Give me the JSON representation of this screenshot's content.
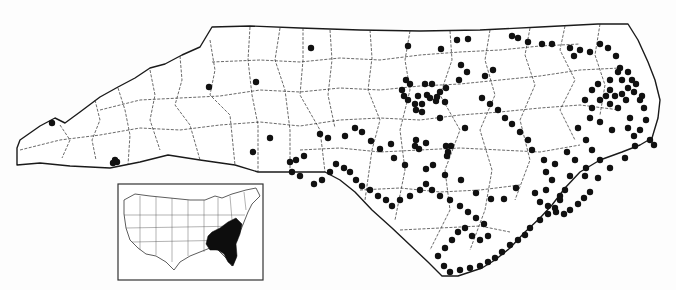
{
  "map": {
    "title": "",
    "colors": {
      "background": "#fdfdfd",
      "outline": "#1a1a1a",
      "dot": "#111111",
      "range": "#0d0d0d"
    },
    "state_outline": "M17,148 L20,140 L40,126 L55,118 L65,123 L80,112 L100,97 L118,87 L135,78 L150,68 L165,64 L182,55 L200,47 L212,27 L250,26 L300,28 L360,30 L420,31 L480,30 L540,27 L598,24 L628,24 L638,40 L648,62 L655,80 L660,100 L658,118 L652,138 L640,145 L622,152 L600,160 L580,172 L565,188 L552,205 L540,218 L525,232 L510,248 L495,260 L482,268 L470,272 L458,276 L442,276 L428,262 L410,245 L392,228 L372,210 L355,192 L340,180 L325,172 L290,172 L258,172 L235,165 L200,160 L168,155 L140,162 L110,168 L70,166 L40,163 L17,165 Z",
    "county_lines": [
      "M60,125 L70,140 L62,158",
      "M95,100 L100,120 L92,140 L96,160",
      "M118,88 L125,110 L130,135 L128,165",
      "M150,70 L155,95 L150,120 L160,150",
      "M180,56 L182,80 L175,105 L190,125 L200,160",
      "M210,40 L215,70 L210,95 L230,115 L235,165",
      "M250,27 L248,60 L252,95 L258,125 L258,172",
      "M280,28 L275,60 L285,90 L290,130 L290,172",
      "M303,28 L303,60 L300,95 L320,130 L325,172",
      "M330,30 L332,60 L328,95 L335,128",
      "M370,30 L372,58 L368,90 L380,120 L372,150 L365,200",
      "M410,31 L405,60 L410,90 L400,130 L405,170 L395,220",
      "M450,31 L452,60 L440,95 L460,130 L445,170 L450,210 L430,250",
      "M490,30 L485,60 L495,95 L480,130 L492,170 L485,210 L470,250",
      "M530,28 L525,55 L535,85 L520,120 L530,160 L515,200",
      "M565,26 L560,50 L575,80 L560,110 L575,140",
      "M600,24 L595,55 L605,85 L600,115",
      "M20,150 L60,140 L100,135 L140,128 L180,130 L220,125 L260,122 L300,126 L340,120 L380,118 L420,120 L460,115 L500,112 L540,108 L580,105 L620,110",
      "M100,110 L140,100 L180,98 L220,96 L260,90 L300,92 L340,88 L380,90 L420,86 L460,84 L500,80 L540,76 L580,70 L620,68",
      "M212,62 L260,60 L300,62 L340,58 L380,60 L420,55 L460,52 L500,50 L540,46 L580,44",
      "M300,150 L340,148 L380,152 L420,150 L460,148 L500,150 L540,152 L580,145",
      "M360,190 L400,188 L440,192 L480,190 L520,185",
      "M400,230 L440,228 L480,226 L510,232"
    ],
    "dots": [
      [
        52,
        123
      ],
      [
        115,
        160
      ],
      [
        117,
        162
      ],
      [
        113,
        163
      ],
      [
        209,
        87
      ],
      [
        256,
        82
      ],
      [
        311,
        48
      ],
      [
        408,
        46
      ],
      [
        270,
        138
      ],
      [
        253,
        152
      ],
      [
        406,
        80
      ],
      [
        410,
        84
      ],
      [
        402,
        90
      ],
      [
        404,
        96
      ],
      [
        408,
        100
      ],
      [
        425,
        84
      ],
      [
        432,
        84
      ],
      [
        418,
        96
      ],
      [
        427,
        95
      ],
      [
        437,
        97
      ],
      [
        430,
        98
      ],
      [
        440,
        92
      ],
      [
        446,
        88
      ],
      [
        415,
        104
      ],
      [
        422,
        104
      ],
      [
        436,
        101
      ],
      [
        445,
        102
      ],
      [
        416,
        110
      ],
      [
        422,
        112
      ],
      [
        440,
        118
      ],
      [
        457,
        40
      ],
      [
        441,
        49
      ],
      [
        468,
        39
      ],
      [
        485,
        76
      ],
      [
        493,
        70
      ],
      [
        461,
        65
      ],
      [
        467,
        72
      ],
      [
        459,
        80
      ],
      [
        416,
        140
      ],
      [
        415,
        146
      ],
      [
        419,
        149
      ],
      [
        426,
        143
      ],
      [
        451,
        146
      ],
      [
        446,
        146
      ],
      [
        448,
        152
      ],
      [
        447,
        156
      ],
      [
        465,
        128
      ],
      [
        512,
        36
      ],
      [
        518,
        38
      ],
      [
        528,
        42
      ],
      [
        542,
        44
      ],
      [
        552,
        44
      ],
      [
        570,
        48
      ],
      [
        574,
        56
      ],
      [
        580,
        50
      ],
      [
        590,
        52
      ],
      [
        600,
        44
      ],
      [
        608,
        48
      ],
      [
        616,
        56
      ],
      [
        620,
        68
      ],
      [
        628,
        72
      ],
      [
        632,
        80
      ],
      [
        622,
        80
      ],
      [
        618,
        72
      ],
      [
        610,
        80
      ],
      [
        598,
        84
      ],
      [
        592,
        90
      ],
      [
        585,
        100
      ],
      [
        592,
        108
      ],
      [
        600,
        100
      ],
      [
        606,
        96
      ],
      [
        610,
        104
      ],
      [
        618,
        108
      ],
      [
        626,
        100
      ],
      [
        634,
        92
      ],
      [
        640,
        100
      ],
      [
        644,
        108
      ],
      [
        630,
        118
      ],
      [
        612,
        130
      ],
      [
        600,
        122
      ],
      [
        590,
        118
      ],
      [
        578,
        128
      ],
      [
        586,
        140
      ],
      [
        592,
        150
      ],
      [
        600,
        160
      ],
      [
        586,
        168
      ],
      [
        570,
        176
      ],
      [
        565,
        190
      ],
      [
        560,
        200
      ],
      [
        555,
        208
      ],
      [
        548,
        214
      ],
      [
        540,
        220
      ],
      [
        530,
        228
      ],
      [
        525,
        235
      ],
      [
        518,
        240
      ],
      [
        510,
        245
      ],
      [
        502,
        252
      ],
      [
        495,
        258
      ],
      [
        488,
        262
      ],
      [
        480,
        266
      ],
      [
        470,
        268
      ],
      [
        460,
        270
      ],
      [
        450,
        272
      ],
      [
        444,
        266
      ],
      [
        438,
        256
      ],
      [
        445,
        248
      ],
      [
        452,
        240
      ],
      [
        458,
        232
      ],
      [
        465,
        228
      ],
      [
        472,
        236
      ],
      [
        480,
        240
      ],
      [
        488,
        236
      ],
      [
        484,
        224
      ],
      [
        476,
        218
      ],
      [
        468,
        212
      ],
      [
        460,
        206
      ],
      [
        450,
        200
      ],
      [
        440,
        196
      ],
      [
        432,
        190
      ],
      [
        426,
        184
      ],
      [
        420,
        190
      ],
      [
        410,
        196
      ],
      [
        400,
        200
      ],
      [
        392,
        206
      ],
      [
        386,
        200
      ],
      [
        378,
        196
      ],
      [
        370,
        190
      ],
      [
        362,
        186
      ],
      [
        356,
        180
      ],
      [
        350,
        172
      ],
      [
        344,
        168
      ],
      [
        336,
        164
      ],
      [
        330,
        172
      ],
      [
        322,
        180
      ],
      [
        314,
        184
      ],
      [
        300,
        176
      ],
      [
        292,
        172
      ],
      [
        290,
        162
      ],
      [
        296,
        160
      ],
      [
        304,
        156
      ],
      [
        320,
        134
      ],
      [
        328,
        138
      ],
      [
        345,
        136
      ],
      [
        355,
        128
      ],
      [
        362,
        132
      ],
      [
        371,
        141
      ],
      [
        380,
        149
      ],
      [
        391,
        144
      ],
      [
        394,
        158
      ],
      [
        405,
        165
      ],
      [
        426,
        169
      ],
      [
        433,
        165
      ],
      [
        445,
        175
      ],
      [
        461,
        180
      ],
      [
        476,
        193
      ],
      [
        491,
        199
      ],
      [
        504,
        199
      ],
      [
        516,
        188
      ],
      [
        535,
        193
      ],
      [
        546,
        190
      ],
      [
        546,
        172
      ],
      [
        555,
        164
      ],
      [
        567,
        152
      ],
      [
        575,
        160
      ],
      [
        585,
        176
      ],
      [
        598,
        178
      ],
      [
        610,
        168
      ],
      [
        625,
        158
      ],
      [
        635,
        146
      ],
      [
        650,
        140
      ],
      [
        654,
        145
      ],
      [
        540,
        202
      ],
      [
        548,
        206
      ],
      [
        556,
        212
      ],
      [
        564,
        214
      ],
      [
        570,
        210
      ],
      [
        578,
        204
      ],
      [
        584,
        198
      ],
      [
        590,
        192
      ],
      [
        560,
        196
      ],
      [
        552,
        180
      ],
      [
        544,
        160
      ],
      [
        532,
        150
      ],
      [
        528,
        140
      ],
      [
        520,
        132
      ],
      [
        512,
        124
      ],
      [
        505,
        118
      ],
      [
        498,
        110
      ],
      [
        490,
        104
      ],
      [
        482,
        98
      ],
      [
        610,
        90
      ],
      [
        615,
        96
      ],
      [
        622,
        94
      ],
      [
        628,
        88
      ],
      [
        636,
        84
      ],
      [
        642,
        96
      ],
      [
        646,
        120
      ],
      [
        640,
        130
      ],
      [
        634,
        136
      ],
      [
        628,
        128
      ]
    ],
    "inset": {
      "frame": {
        "x": 118,
        "y": 184,
        "w": 145,
        "h": 96
      },
      "us_outline": "M124,200 L135,194 L150,196 L170,198 L190,200 L205,200 L215,196 L222,198 L232,194 L246,190 L256,188 L260,196 L252,204 L248,212 L244,222 L240,232 L234,242 L236,258 L232,266 L226,258 L218,250 L210,248 L200,252 L190,256 L180,262 L174,270 L166,262 L156,256 L146,254 L138,248 L130,240 L126,228 L124,214 Z",
      "range_shape": "M212,232 L220,228 L228,222 L236,218 L242,224 L240,234 L236,244 L237,256 L233,266 L228,262 L224,254 L218,250 L210,250 L206,244 L208,236 Z",
      "state_lines": [
        "M140,196 L140,250",
        "M156,197 L156,255",
        "M172,198 L172,262",
        "M188,200 L188,256",
        "M204,200 L204,252",
        "M218,198 L218,250",
        "M124,215 L245,215",
        "M126,228 L242,226",
        "M132,242 L238,240",
        "M230,196 L232,220",
        "M244,192 L246,210"
      ]
    }
  }
}
